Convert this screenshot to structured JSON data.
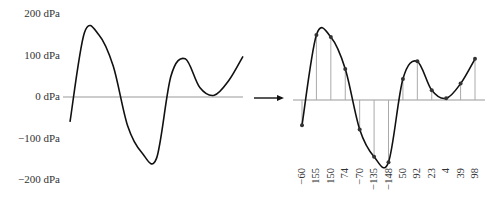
{
  "chart_data": [
    {
      "type": "line",
      "title": "",
      "xlabel": "",
      "ylabel": "",
      "unit": "dPa",
      "ylim": [
        -200,
        200
      ],
      "yticks": [
        200,
        100,
        0,
        -100,
        -200
      ],
      "ytick_labels": [
        "200 dPa",
        "100 dPa",
        "0 dPa",
        "−100 dPa",
        "−200 dPa"
      ],
      "grid": false,
      "legend": null,
      "description": "Continuous analog waveform",
      "approx_curve": {
        "x": [
          0,
          1,
          2,
          3,
          4,
          5,
          6,
          7,
          8,
          9,
          10,
          11,
          12
        ],
        "values": [
          -60,
          155,
          150,
          74,
          -70,
          -135,
          -148,
          50,
          92,
          23,
          4,
          39,
          98
        ]
      }
    },
    {
      "type": "line",
      "title": "",
      "xlabel": "",
      "ylabel": "",
      "unit": "dPa",
      "ylim": [
        -200,
        200
      ],
      "grid": false,
      "legend": null,
      "description": "Sampled waveform with sample stems and sampled values",
      "categories": [
        "0",
        "1",
        "2",
        "3",
        "4",
        "5",
        "6",
        "7",
        "8",
        "9",
        "10",
        "11",
        "12"
      ],
      "values": [
        -60,
        155,
        150,
        74,
        -70,
        -135,
        -148,
        50,
        92,
        23,
        4,
        39,
        98
      ],
      "sample_labels": [
        "−60",
        "155",
        "150",
        "74",
        "−70",
        "−135",
        "−148",
        "50",
        "92",
        "23",
        "4",
        "39",
        "98"
      ]
    }
  ],
  "arrow": {
    "direction": "right",
    "meaning": "sampling"
  },
  "colors": {
    "curve": "#111111",
    "axis": "#999999",
    "stem": "#aaaaaa",
    "text": "#333333"
  }
}
